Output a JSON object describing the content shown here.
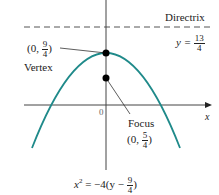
{
  "diagram": {
    "colors": {
      "curve": "#1f8a8a",
      "axes": "#444444",
      "points": "#000000",
      "directrix": "#555555"
    },
    "directrix": {
      "label": "Directrix",
      "eq_lhs": "y =",
      "eq_num": "13",
      "eq_den": "4"
    },
    "vertex": {
      "coord_open": "(0,",
      "coord_num": "9",
      "coord_den": "4",
      "coord_close": ")",
      "label": "Vertex"
    },
    "focus": {
      "label": "Focus",
      "coord_open": "(0,",
      "coord_num": "5",
      "coord_den": "4",
      "coord_close": ")"
    },
    "axes": {
      "origin_label": "0",
      "x_label": "x"
    },
    "equation": {
      "lhs": "x",
      "sup": "2",
      "mid": " = −4(y −",
      "num": "9",
      "den": "4",
      "close": ")"
    }
  }
}
